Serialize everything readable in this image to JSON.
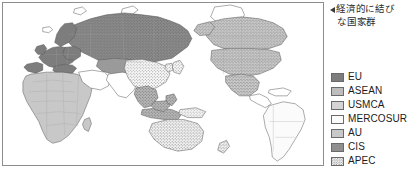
{
  "caption": {
    "marker_icon": "left-triangle-icon",
    "line1": "経済的に結び",
    "line2": "な国家群"
  },
  "legend": {
    "items": [
      {
        "label": "EU",
        "color": "#7d7d7d",
        "pattern": "solid",
        "swatch_name": "legend-swatch-eu"
      },
      {
        "label": "ASEAN",
        "color": "#bdbdbd",
        "pattern": "solid",
        "swatch_name": "legend-swatch-asean"
      },
      {
        "label": "USMCA",
        "color": "#d4d4d4",
        "pattern": "solid",
        "swatch_name": "legend-swatch-usmca"
      },
      {
        "label": "MERCOSUR",
        "color": "#fbfbfb",
        "pattern": "solid",
        "swatch_name": "legend-swatch-mercosur"
      },
      {
        "label": "AU",
        "color": "#c8c8c8",
        "pattern": "solid",
        "swatch_name": "legend-swatch-au"
      },
      {
        "label": "CIS",
        "color": "#8f8f8f",
        "pattern": "solid",
        "swatch_name": "legend-swatch-cis"
      },
      {
        "label": "APEC",
        "color": "#ffffff",
        "pattern": "dotted",
        "swatch_name": "legend-swatch-apec"
      }
    ]
  },
  "map": {
    "title": "world-economic-blocs-map",
    "frame_color": "#8d8d8d",
    "ocean_color": "#ffffff",
    "coast_color": "#555555",
    "border_color": "#9a9a9a",
    "regions": [
      {
        "name": "eu-europe",
        "bloc": "EU",
        "fill": "#7d7d7d",
        "overlay": "none"
      },
      {
        "name": "cis-russia",
        "bloc": "CIS",
        "fill": "#8f8f8f",
        "overlay": "dotted"
      },
      {
        "name": "cis-central-asia",
        "bloc": "CIS",
        "fill": "#9a9a9a",
        "overlay": "none"
      },
      {
        "name": "usmca-north-america",
        "bloc": "USMCA",
        "fill": "#d4d4d4",
        "overlay": "dotted"
      },
      {
        "name": "mercosur-south-america",
        "bloc": "MERCOSUR",
        "fill": "#fbfbfb",
        "overlay": "none"
      },
      {
        "name": "au-africa",
        "bloc": "AU",
        "fill": "#c8c8c8",
        "overlay": "none"
      },
      {
        "name": "asean-southeast-asia",
        "bloc": "ASEAN",
        "fill": "#bdbdbd",
        "overlay": "dotted"
      },
      {
        "name": "apec-east-asia",
        "bloc": "APEC",
        "fill": "#ffffff",
        "overlay": "dotted"
      },
      {
        "name": "apec-australia",
        "bloc": "APEC",
        "fill": "#ffffff",
        "overlay": "dotted"
      }
    ]
  }
}
